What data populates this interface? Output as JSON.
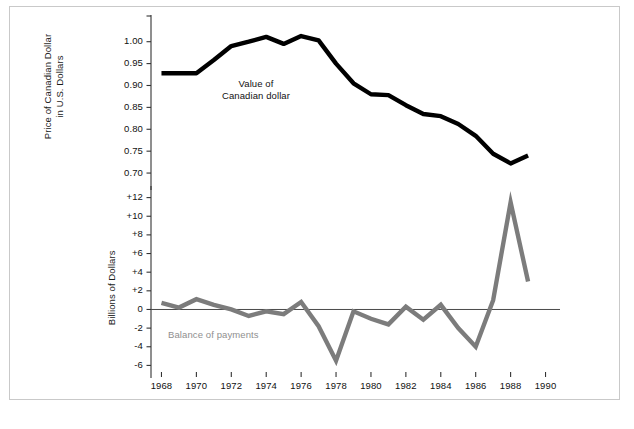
{
  "figure": {
    "background_color": "#ffffff",
    "frame_color": "#c9c9c9"
  },
  "chart_data": [
    {
      "type": "line",
      "panel": "top",
      "title": "",
      "xlabel": "",
      "ylabel": "Price of Canadian Dollar\nin U.S. Dollars",
      "series_label": "Value of\nCanadian dollar",
      "color": "#000000",
      "line_width": 4.4,
      "grid": false,
      "legend_position": "inline-annotation",
      "xlim": [
        1967.4,
        1990.6
      ],
      "ylim": [
        0.675,
        1.045
      ],
      "yticks": [
        0.7,
        0.75,
        0.8,
        0.85,
        0.9,
        0.95,
        1.0
      ],
      "ytick_labels": [
        "0.70",
        "0.75",
        "0.80",
        "0.85",
        "0.90",
        "0.95",
        "1.00"
      ],
      "x": [
        1968,
        1969,
        1970,
        1971,
        1972,
        1973,
        1974,
        1975,
        1976,
        1977,
        1978,
        1979,
        1980,
        1981,
        1982,
        1983,
        1984,
        1985,
        1986,
        1987,
        1988,
        1989
      ],
      "values": [
        0.928,
        0.928,
        0.928,
        0.958,
        0.99,
        1.0,
        1.011,
        0.995,
        1.013,
        1.003,
        0.95,
        0.905,
        0.88,
        0.878,
        0.855,
        0.835,
        0.83,
        0.812,
        0.785,
        0.744,
        0.722,
        0.74
      ]
    },
    {
      "type": "line",
      "panel": "bottom",
      "title": "",
      "xlabel": "",
      "ylabel": "Billions of Dollars",
      "series_label": "Balance of payments",
      "color": "#7c7c7c",
      "line_width": 4.4,
      "grid": false,
      "zero_line": true,
      "legend_position": "inline-annotation",
      "xlim": [
        1967.4,
        1990.6
      ],
      "ylim": [
        -6.6,
        12.6
      ],
      "yticks": [
        -6,
        -4,
        -2,
        0,
        2,
        4,
        6,
        8,
        10,
        12
      ],
      "ytick_labels": [
        "-6",
        "-4",
        "-2",
        "0",
        "+2",
        "+4",
        "+6",
        "+8",
        "+10",
        "+12"
      ],
      "x": [
        1968,
        1969,
        1970,
        1971,
        1972,
        1973,
        1974,
        1975,
        1976,
        1977,
        1978,
        1979,
        1980,
        1981,
        1982,
        1983,
        1984,
        1985,
        1986,
        1987,
        1988,
        1989
      ],
      "values": [
        0.7,
        0.2,
        1.1,
        0.5,
        0.0,
        -0.7,
        -0.2,
        -0.5,
        0.8,
        -1.8,
        -5.5,
        -0.2,
        -1.0,
        -1.6,
        0.3,
        -1.1,
        0.5,
        -2.0,
        -4.0,
        1.0,
        11.5,
        3.0
      ]
    }
  ],
  "axes": {
    "xticks": [
      1968,
      1970,
      1972,
      1974,
      1976,
      1978,
      1980,
      1982,
      1984,
      1986,
      1988,
      1990
    ],
    "xtick_labels": [
      "1968",
      "1970",
      "1972",
      "1974",
      "1976",
      "1978",
      "1980",
      "1982",
      "1984",
      "1986",
      "1988",
      "1990"
    ]
  },
  "labels": {
    "ytitle_top": "Price of Canadian Dollar\nin U.S. Dollars",
    "ytitle_bottom": "Billions of Dollars",
    "series_top": "Value of\nCanadian dollar",
    "series_bottom": "Balance of payments"
  }
}
